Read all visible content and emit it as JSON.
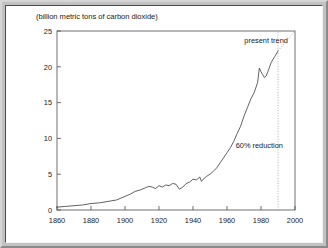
{
  "figure": {
    "title": "(billion metric tons of carbon dioxide)",
    "background_color": "#ffffff",
    "frame_color": "#b9b9b9"
  },
  "annotations": {
    "present_trend": "present trend",
    "reduction": "60% reduction"
  },
  "axes": {
    "x_ticks": [
      "1860",
      "1880",
      "1900",
      "1920",
      "1940",
      "1960",
      "1980",
      "2000"
    ],
    "y_ticks": [
      "0",
      "5",
      "10",
      "15",
      "20",
      "25"
    ]
  },
  "chart_data": {
    "type": "line",
    "title": "(billion metric tons of carbon dioxide)",
    "xlabel": "",
    "ylabel": "billion metric tons of carbon dioxide",
    "xlim": [
      1860,
      2000
    ],
    "ylim": [
      0,
      25
    ],
    "xticks": [
      1860,
      1880,
      1900,
      1920,
      1940,
      1960,
      1980,
      2000
    ],
    "yticks": [
      0,
      5,
      10,
      15,
      20,
      25
    ],
    "grid": false,
    "legend": "none",
    "annotations": [
      {
        "text": "present trend",
        "x": 1983,
        "y": 23.3
      },
      {
        "text": "60% reduction",
        "x": 1979,
        "y": 8.7
      }
    ],
    "series": [
      {
        "name": "Global CO2 emissions",
        "style": "solid",
        "color": "#3a3a3a",
        "x": [
          1860,
          1865,
          1870,
          1875,
          1880,
          1885,
          1890,
          1895,
          1900,
          1903,
          1906,
          1909,
          1912,
          1914,
          1916,
          1918,
          1920,
          1922,
          1924,
          1926,
          1928,
          1930,
          1932,
          1934,
          1936,
          1938,
          1940,
          1942,
          1944,
          1945,
          1946,
          1948,
          1950,
          1952,
          1954,
          1956,
          1958,
          1960,
          1962,
          1964,
          1966,
          1968,
          1970,
          1972,
          1974,
          1976,
          1978,
          1979,
          1980,
          1981,
          1982,
          1983,
          1984,
          1986,
          1988,
          1990
        ],
        "y": [
          0.4,
          0.5,
          0.6,
          0.7,
          0.9,
          1.0,
          1.2,
          1.4,
          1.9,
          2.2,
          2.6,
          2.8,
          3.1,
          3.3,
          3.2,
          3.0,
          3.4,
          3.2,
          3.5,
          3.4,
          3.7,
          3.6,
          2.9,
          3.2,
          3.7,
          3.9,
          4.3,
          4.2,
          4.6,
          4.0,
          4.3,
          4.7,
          5.0,
          5.4,
          5.9,
          6.6,
          7.3,
          8.0,
          8.7,
          9.6,
          10.7,
          11.7,
          13.1,
          14.3,
          15.5,
          16.4,
          17.8,
          19.8,
          19.3,
          18.9,
          18.5,
          18.7,
          19.3,
          20.6,
          21.4,
          22.2
        ]
      },
      {
        "name": "present trend projection",
        "style": "dotted",
        "color": "#9a9a9a",
        "x": [
          1990,
          2000
        ],
        "y": [
          22.2,
          25.0
        ]
      },
      {
        "name": "60% reduction reference",
        "style": "dotted-vertical",
        "color": "#9a9a9a",
        "x": [
          1990,
          1990
        ],
        "y": [
          0.0,
          25.0
        ]
      }
    ]
  }
}
